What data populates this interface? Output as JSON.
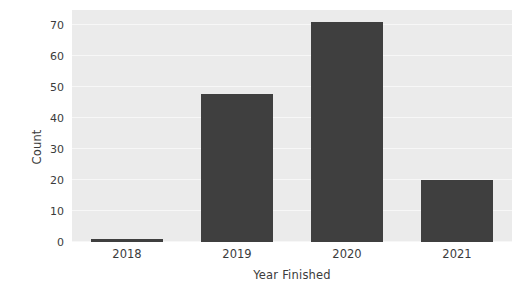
{
  "chart_data": {
    "type": "bar",
    "title": "",
    "subtitle": "",
    "xlabel": "Year Finished",
    "ylabel": "Count",
    "categories": [
      "2018",
      "2019",
      "2020",
      "2021"
    ],
    "values": [
      1,
      48,
      71,
      20
    ],
    "series": [
      {
        "name": "Count",
        "values": [
          1,
          48,
          71,
          20
        ]
      }
    ],
    "ylim": [
      0,
      75
    ],
    "xlim": [
      -0.5,
      3.5
    ],
    "yticks": [
      0,
      10,
      20,
      30,
      40,
      50,
      60,
      70
    ],
    "ytick_labels": [
      "0",
      "10",
      "20",
      "30",
      "40",
      "50",
      "60",
      "70"
    ],
    "xtick_labels": [
      "2018",
      "2019",
      "2020",
      "2021"
    ],
    "grid": true,
    "grid_axis": "y",
    "legend": false,
    "legend_position": "none",
    "annotations": [],
    "colors": {
      "bar": "#3f3f3f",
      "plot_background": "#ebebeb",
      "figure_background": "#ffffff",
      "gridline": "#f7f7f7",
      "text": "#3b3b3b"
    }
  }
}
